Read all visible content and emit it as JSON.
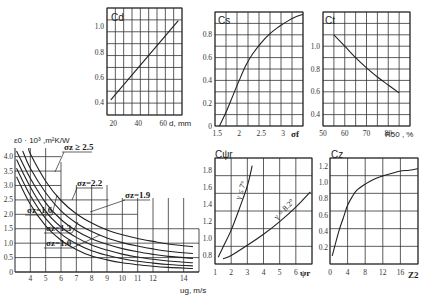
{
  "chart_data": [
    {
      "id": "main",
      "type": "line",
      "title": "",
      "ylabel": "ε0 · 10^3, m²K/W",
      "xlabel": "ug, m/s",
      "x_ticks": [
        "4",
        "5",
        "6",
        "7",
        "8",
        "9",
        "10",
        "11",
        "12",
        "14"
      ],
      "y_ticks": [
        "0",
        "0.5",
        "1.0",
        "1.5",
        "2.0",
        "2.5",
        "3.0",
        "3.5",
        "4.0"
      ],
      "xlim": [
        3,
        15
      ],
      "ylim": [
        0,
        4.3
      ],
      "series": [
        {
          "name": "σz=1.0",
          "x": [
            3.1,
            4,
            5,
            6,
            7,
            8,
            9,
            10,
            11,
            12,
            13,
            14.6
          ],
          "values": [
            3.3,
            2.35,
            1.6,
            1.1,
            0.78,
            0.55,
            0.42,
            0.32,
            0.25,
            0.2,
            0.16,
            0.12
          ]
        },
        {
          "name": "σz=1.3",
          "x": [
            3.1,
            4,
            5,
            6,
            7,
            8,
            9,
            10,
            11,
            12,
            13,
            14.6
          ],
          "values": [
            3.6,
            2.65,
            1.85,
            1.32,
            0.98,
            0.74,
            0.58,
            0.46,
            0.37,
            0.31,
            0.26,
            0.21
          ]
        },
        {
          "name": "σz=1.6",
          "x": [
            3.1,
            4,
            5,
            6,
            7,
            8,
            9,
            10,
            11,
            12,
            13,
            14.6
          ],
          "values": [
            3.9,
            2.95,
            2.1,
            1.56,
            1.2,
            0.94,
            0.76,
            0.62,
            0.52,
            0.44,
            0.38,
            0.32
          ]
        },
        {
          "name": "σz=1.9",
          "x": [
            3.1,
            4,
            5,
            6,
            7,
            8,
            9,
            10,
            11,
            12,
            13,
            14.6
          ],
          "values": [
            4.2,
            3.25,
            2.4,
            1.82,
            1.43,
            1.15,
            0.96,
            0.81,
            0.7,
            0.61,
            0.54,
            0.47
          ]
        },
        {
          "name": "σz=2.2",
          "x": [
            3.5,
            4,
            5,
            6,
            7,
            8,
            9,
            10,
            11,
            12,
            13,
            14.6
          ],
          "values": [
            4.2,
            3.6,
            2.75,
            2.12,
            1.7,
            1.4,
            1.18,
            1.02,
            0.9,
            0.8,
            0.72,
            0.64
          ]
        },
        {
          "name": "σz≥2.5",
          "x": [
            3.9,
            4,
            5,
            6,
            7,
            8,
            9,
            10,
            11,
            12,
            13,
            14.6
          ],
          "values": [
            4.3,
            4.1,
            3.15,
            2.48,
            2.02,
            1.7,
            1.46,
            1.29,
            1.16,
            1.06,
            0.97,
            0.88
          ]
        }
      ],
      "annotations": [
        "σz≥2.5",
        "σz=2.2",
        "σz=1.9",
        "σz=1.6",
        "σz=1.3",
        "σz=1.0"
      ]
    },
    {
      "id": "cd",
      "type": "line",
      "ylabel": "Cd",
      "xlabel": "d, mm",
      "x_ticks": [
        "20",
        "40",
        "60"
      ],
      "y_ticks": [
        "0.4",
        "0.6",
        "0.8",
        "1.0"
      ],
      "xlim": [
        15,
        75
      ],
      "ylim": [
        0.3,
        1.15
      ],
      "series": [
        {
          "name": "Cd",
          "x": [
            18,
            72
          ],
          "values": [
            0.42,
            1.05
          ]
        }
      ]
    },
    {
      "id": "cs",
      "type": "line",
      "ylabel": "Cs",
      "xlabel": "σf",
      "x_ticks": [
        "1.5",
        "2",
        "2.5",
        "3"
      ],
      "y_ticks": [
        "0",
        "0.2",
        "0.4",
        "0.6",
        "0.8"
      ],
      "xlim": [
        1.45,
        3.45
      ],
      "ylim": [
        0,
        1.0
      ],
      "series": [
        {
          "name": "Cs",
          "x": [
            1.55,
            1.7,
            1.85,
            2.0,
            2.15,
            2.3,
            2.5,
            2.7,
            2.9,
            3.1,
            3.3,
            3.45
          ],
          "values": [
            0,
            0.12,
            0.26,
            0.4,
            0.53,
            0.63,
            0.73,
            0.81,
            0.87,
            0.92,
            0.96,
            0.98
          ]
        }
      ]
    },
    {
      "id": "ct",
      "type": "line",
      "ylabel": "Ct",
      "xlabel": "R50, %",
      "x_ticks": [
        "50",
        "60",
        "70",
        "80"
      ],
      "y_ticks": [
        "0.4",
        "0.6",
        "0.8",
        "1.0"
      ],
      "xlim": [
        50,
        90
      ],
      "ylim": [
        0.3,
        1.3
      ],
      "series": [
        {
          "name": "Ct",
          "x": [
            55,
            60,
            65,
            70,
            75,
            80,
            85
          ],
          "values": [
            1.1,
            1.0,
            0.9,
            0.81,
            0.73,
            0.66,
            0.59
          ]
        }
      ]
    },
    {
      "id": "cpsi",
      "type": "line",
      "ylabel": "Cψr",
      "xlabel": "ψr",
      "x_ticks": [
        "1",
        "2",
        "3",
        "4",
        "5",
        "6"
      ],
      "y_ticks": [
        "0.8",
        "1.0",
        "1.2",
        "1.4",
        "1.6",
        "1.8"
      ],
      "xlim": [
        1,
        7
      ],
      "ylim": [
        0.7,
        1.95
      ],
      "series": [
        {
          "name": "γ≤7°",
          "x": [
            1.2,
            1.5,
            2,
            2.5,
            3,
            3.3
          ],
          "values": [
            0.78,
            0.9,
            1.1,
            1.35,
            1.62,
            1.86
          ]
        },
        {
          "name": "γ=8.2°",
          "x": [
            1.5,
            2,
            3,
            4,
            5,
            6,
            6.9
          ],
          "values": [
            0.76,
            0.8,
            0.92,
            1.05,
            1.2,
            1.37,
            1.55
          ]
        }
      ],
      "annotations": [
        "γ≤7°",
        "γ=8.2°"
      ]
    },
    {
      "id": "cz",
      "type": "line",
      "ylabel": "Cz",
      "xlabel": "Z2",
      "x_ticks": [
        "0",
        "4",
        "8",
        "12",
        "16"
      ],
      "y_ticks": [
        "0.2",
        "0.4",
        "0.6",
        "0.8",
        "1.0",
        "1.2"
      ],
      "xlim": [
        0,
        20
      ],
      "ylim": [
        0,
        1.3
      ],
      "series": [
        {
          "name": "Cz",
          "x": [
            0.5,
            2,
            3,
            4,
            5,
            6,
            8,
            10,
            12,
            14,
            16,
            18,
            20
          ],
          "values": [
            0.1,
            0.4,
            0.56,
            0.72,
            0.82,
            0.9,
            0.98,
            1.04,
            1.08,
            1.11,
            1.14,
            1.15,
            1.17
          ]
        }
      ]
    }
  ],
  "labels": {
    "main_y": "ε0 · 10³ ,m²K/W",
    "main_x": "ug, m/s",
    "cd_y": "Cd",
    "cd_x": "d, mm",
    "cs_y": "Cs",
    "cs_x": "σf",
    "ct_y": "Ct",
    "ct_x": "R50 , %",
    "cpsi_y": "Cψr",
    "cpsi_x": "ψr",
    "cz_y": "Cz",
    "cz_x": "Z2",
    "ann_25": "σz ≥ 2.5",
    "ann_22": "σz=2.2",
    "ann_19": "σz=1.9",
    "ann_16": "σz=1.6",
    "ann_13": "σz=1.3",
    "ann_10": "σz=1.0",
    "ann_g7": "γ ≤ 7°",
    "ann_g82": "γ = 8.2°"
  }
}
